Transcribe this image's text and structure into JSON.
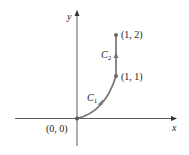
{
  "diagram": {
    "axes": {
      "x_label": "x",
      "y_label": "y"
    },
    "points": [
      {
        "name": "origin",
        "label": "(0, 0)"
      },
      {
        "name": "p11",
        "label": "(1, 1)"
      },
      {
        "name": "p12",
        "label": "(1, 2)"
      }
    ],
    "curves": [
      {
        "name": "C1",
        "base": "C",
        "sub": "1",
        "description": "curve from (0, 0) to (1, 1)"
      },
      {
        "name": "C2",
        "base": "C",
        "sub": "2",
        "description": "vertical segment from (1, 1) to (1, 2)"
      }
    ],
    "colors": {
      "axis": "#333333",
      "path": "#7a7a7a",
      "point": "#666666"
    }
  }
}
